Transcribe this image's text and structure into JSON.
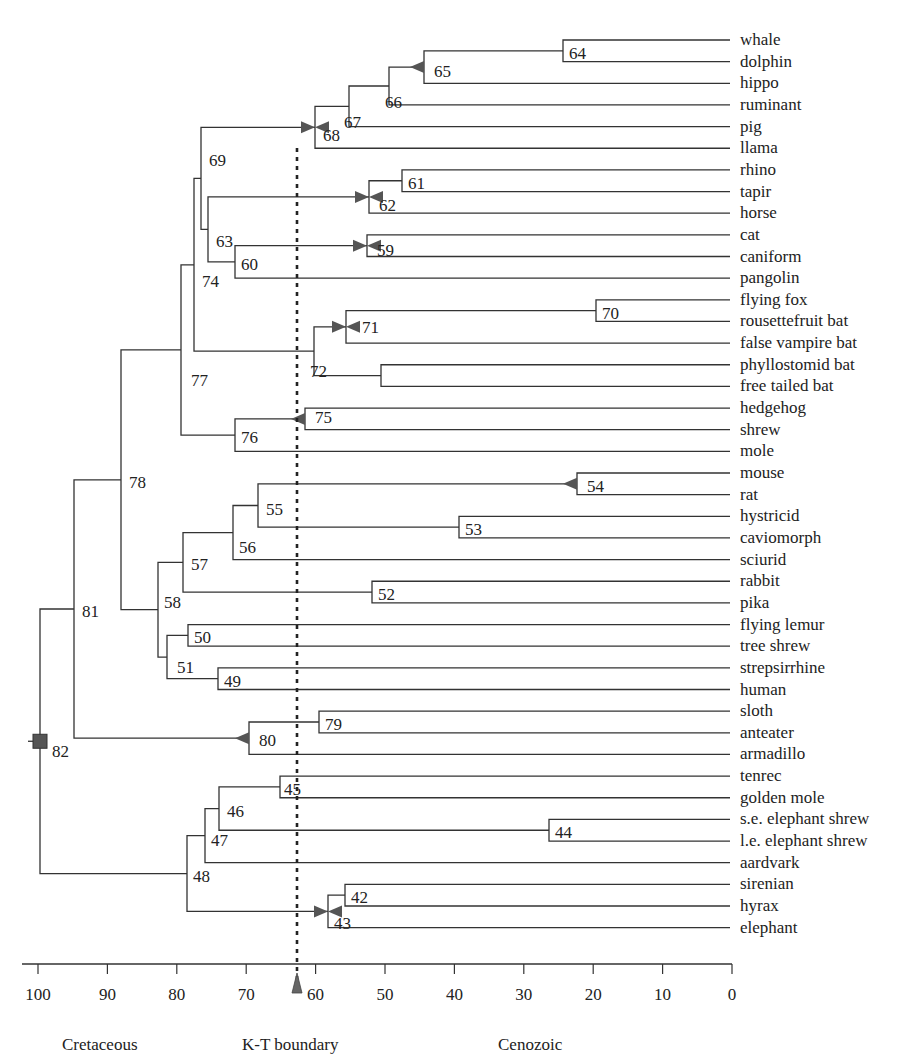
{
  "chart_data": {
    "type": "dendrogram",
    "title": "",
    "xlabel": "",
    "axis": {
      "direction": "reversed",
      "range": [
        100,
        0
      ],
      "ticks": [
        100,
        90,
        80,
        70,
        60,
        50,
        40,
        30,
        20,
        10,
        0
      ],
      "units": "million years ago"
    },
    "eras": [
      {
        "label": "Cretaceous",
        "x_px": 62
      },
      {
        "label": "K-T boundary",
        "x_px": 242
      },
      {
        "label": "Cenozoic",
        "x_px": 498
      }
    ],
    "kt_boundary": {
      "age": 65,
      "marker": "triangle-up-icon"
    },
    "leaves": [
      "whale",
      "dolphin",
      "hippo",
      "ruminant",
      "pig",
      "llama",
      "rhino",
      "tapir",
      "horse",
      "cat",
      "caniform",
      "pangolin",
      "flying fox",
      "rousettefruit bat",
      "false vampire bat",
      "phyllostomid bat",
      "free tailed bat",
      "hedgehog",
      "shrew",
      "mole",
      "mouse",
      "rat",
      "hystricid",
      "caviomorph",
      "sciurid",
      "rabbit",
      "pika",
      "flying lemur",
      "tree shrew",
      "strepsirrhine",
      "human",
      "sloth",
      "anteater",
      "armadillo",
      "tenrec",
      "golden mole",
      "s.e. elephant shrew",
      "l.e. elephant shrew",
      "aardvark",
      "sirenian",
      "hyrax",
      "elephant"
    ],
    "nodes": [
      {
        "id": "64",
        "age": 25,
        "children": [
          "whale",
          "dolphin"
        ]
      },
      {
        "id": "65",
        "age": 45,
        "children": [
          "64",
          "hippo"
        ],
        "marker": "left"
      },
      {
        "id": "66",
        "age": 50,
        "children": [
          "65",
          "ruminant"
        ]
      },
      {
        "id": "67",
        "age": 55,
        "children": [
          "66",
          "pig"
        ]
      },
      {
        "id": "68",
        "age": 60,
        "children": [
          "67",
          "llama"
        ],
        "marker": "both"
      },
      {
        "id": "61",
        "age": 47,
        "children": [
          "rhino",
          "tapir"
        ]
      },
      {
        "id": "62",
        "age": 52,
        "children": [
          "61",
          "horse"
        ],
        "marker": "both"
      },
      {
        "id": "59",
        "age": 52,
        "children": [
          "cat",
          "caniform"
        ],
        "marker": "both"
      },
      {
        "id": "60",
        "age": 71,
        "children": [
          "59",
          "pangolin"
        ]
      },
      {
        "id": "63",
        "age": 76,
        "children": [
          "62",
          "60"
        ]
      },
      {
        "id": "69",
        "age": 77,
        "children": [
          "68",
          "63"
        ]
      },
      {
        "id": "74",
        "age": 78,
        "children": [
          "69",
          ""
        ]
      },
      {
        "id": "70",
        "age": 19,
        "children": [
          "flying fox",
          "rousettefruit bat"
        ]
      },
      {
        "id": "71",
        "age": 56,
        "children": [
          "70",
          "false vampire bat"
        ],
        "marker": "both"
      },
      {
        "id": "",
        "age": 51,
        "children": [
          "phyllostomid bat",
          "free tailed bat"
        ]
      },
      {
        "id": "72",
        "age": 60,
        "children": [
          "71",
          ""
        ]
      },
      {
        "id": "77",
        "age": 79,
        "children": [
          "74",
          "72"
        ]
      },
      {
        "id": "75",
        "age": 61,
        "children": [
          "hedgehog",
          "shrew"
        ],
        "marker": "left"
      },
      {
        "id": "76",
        "age": 71,
        "children": [
          "75",
          "mole"
        ]
      },
      {
        "id": "54",
        "age": 22,
        "children": [
          "mouse",
          "rat"
        ],
        "marker": "left"
      },
      {
        "id": "53",
        "age": 39,
        "children": [
          "hystricid",
          "caviomorph"
        ]
      },
      {
        "id": "55",
        "age": 68,
        "children": [
          "54",
          "53"
        ]
      },
      {
        "id": "56",
        "age": 72,
        "children": [
          "55",
          "sciurid"
        ]
      },
      {
        "id": "52",
        "age": 52,
        "children": [
          "rabbit",
          "pika"
        ]
      },
      {
        "id": "57",
        "age": 79,
        "children": [
          "56",
          "52"
        ]
      },
      {
        "id": "50",
        "age": 78,
        "children": [
          "flying lemur",
          "tree shrew"
        ]
      },
      {
        "id": "49",
        "age": 74,
        "children": [
          "strepsirrhine",
          "human"
        ]
      },
      {
        "id": "51",
        "age": 81,
        "children": [
          "50",
          "49"
        ]
      },
      {
        "id": "58",
        "age": 83,
        "children": [
          "57",
          "51"
        ]
      },
      {
        "id": "78",
        "age": 88,
        "children": [
          "77",
          "76",
          "58"
        ]
      },
      {
        "id": "79",
        "age": 59,
        "children": [
          "sloth",
          "anteater"
        ]
      },
      {
        "id": "80",
        "age": 69,
        "children": [
          "79",
          "armadillo"
        ],
        "marker": "left"
      },
      {
        "id": "81",
        "age": 95,
        "children": [
          "78",
          "80"
        ]
      },
      {
        "id": "45",
        "age": 65,
        "children": [
          "tenrec",
          "golden mole"
        ]
      },
      {
        "id": "44",
        "age": 26,
        "children": [
          "s.e. elephant shrew",
          "l.e. elephant shrew"
        ]
      },
      {
        "id": "46",
        "age": 74,
        "children": [
          "45",
          "44"
        ]
      },
      {
        "id": "47",
        "age": 76,
        "children": [
          "46",
          "aardvark"
        ]
      },
      {
        "id": "42",
        "age": 56,
        "children": [
          "sirenian",
          "hyrax"
        ]
      },
      {
        "id": "43",
        "age": 58,
        "children": [
          "42",
          "elephant"
        ],
        "marker": "both"
      },
      {
        "id": "48",
        "age": 78,
        "children": [
          "47",
          "43"
        ]
      },
      {
        "id": "82",
        "age": 100,
        "children": [
          "81",
          "48"
        ],
        "marker": "square"
      }
    ]
  },
  "labels": {
    "leaves": [
      "whale",
      "dolphin",
      "hippo",
      "ruminant",
      "pig",
      "llama",
      "rhino",
      "tapir",
      "horse",
      "cat",
      "caniform",
      "pangolin",
      "flying fox",
      "rousettefruit bat",
      "false vampire bat",
      "phyllostomid bat",
      "free tailed bat",
      "hedgehog",
      "shrew",
      "mole",
      "mouse",
      "rat",
      "hystricid",
      "caviomorph",
      "sciurid",
      "rabbit",
      "pika",
      "flying lemur",
      "tree shrew",
      "strepsirrhine",
      "human",
      "sloth",
      "anteater",
      "armadillo",
      "tenrec",
      "golden mole",
      "s.e. elephant shrew",
      "l.e. elephant shrew",
      "aardvark",
      "sirenian",
      "hyrax",
      "elephant"
    ],
    "ticks": [
      "100",
      "90",
      "80",
      "70",
      "60",
      "50",
      "40",
      "30",
      "20",
      "10",
      "0"
    ],
    "eras": {
      "cretaceous": "Cretaceous",
      "kt": "K-T boundary",
      "cenozoic": "Cenozoic"
    }
  },
  "colors": {
    "line": "#333333",
    "marker": "#555555",
    "text": "#222222"
  }
}
